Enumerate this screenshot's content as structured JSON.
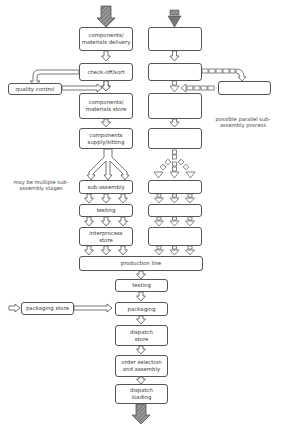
{
  "diagram": {
    "type": "flowchart",
    "main_flow": [
      {
        "id": "delivery",
        "label": "components/ materials delivery"
      },
      {
        "id": "checkoff",
        "label": "check-off/sort"
      },
      {
        "id": "store",
        "label": "components/ materials store"
      },
      {
        "id": "kitting",
        "label": "components supply/kitting"
      },
      {
        "id": "subassembly",
        "label": "sub-assembly"
      },
      {
        "id": "testing1",
        "label": "testing"
      },
      {
        "id": "interprocess",
        "label": "interprocess store"
      },
      {
        "id": "production",
        "label": "production line"
      },
      {
        "id": "testing2",
        "label": "testing"
      },
      {
        "id": "packaging",
        "label": "packaging"
      },
      {
        "id": "dispatchstore",
        "label": "dispatch store"
      },
      {
        "id": "orderselection",
        "label": "order selection and assembly"
      },
      {
        "id": "dispatchloading",
        "label": "dispatch loading"
      }
    ],
    "side_boxes": {
      "quality_control": "quality control",
      "packaging_store": "packaging store"
    },
    "notes": {
      "multiple_stages": "may be multiple sub-assembly stages",
      "parallel": "possible parallel sub-assembly process"
    },
    "colors": {
      "stroke": "#555555",
      "arrow_fill": "#8a8a8a",
      "text": "#3a3a3a"
    }
  }
}
